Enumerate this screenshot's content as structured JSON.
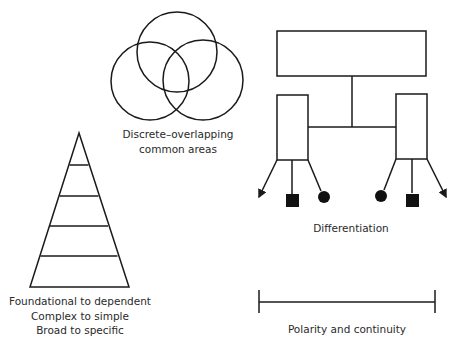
{
  "venn": {
    "label_line1": "Discrete–overlapping",
    "label_line2": "common areas"
  },
  "hierarchy": {
    "label": "Differentiation"
  },
  "pyramid": {
    "label_line1": "Foundational to dependent",
    "label_line2": "Complex to simple",
    "label_line3": "Broad to specific"
  },
  "polarity": {
    "label": "Polarity and continuity"
  },
  "colors": {
    "stroke": "#1a1a1a",
    "background": "#ffffff"
  }
}
